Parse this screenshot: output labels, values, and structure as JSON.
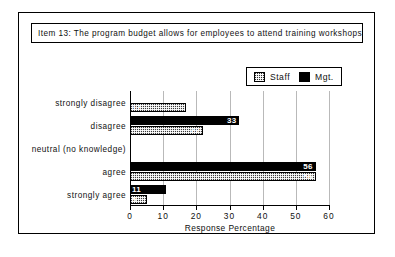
{
  "figure": {
    "item_caption": "Item 13:  The program budget allows for employees to attend training workshops"
  },
  "legend": {
    "entries": [
      {
        "label": "Staff",
        "swatch": "dithered-gray-swatch"
      },
      {
        "label": "Mgt.",
        "swatch": "solid-black-swatch"
      }
    ]
  },
  "chart_data": {
    "type": "bar",
    "orientation": "horizontal",
    "title": "Item 13:  The program budget allows for employees to attend training workshops",
    "categories": [
      "strongly disagree",
      "disagree",
      "neutral (no knowledge)",
      "agree",
      "strongly agree"
    ],
    "series": [
      {
        "name": "Mgt.",
        "values": [
          0,
          33,
          0,
          56,
          11
        ]
      },
      {
        "name": "Staff",
        "values": [
          17,
          22,
          0,
          56,
          5
        ]
      }
    ],
    "xlabel": "Response Percentage",
    "ylabel": "",
    "xlim": [
      0,
      60
    ],
    "xticks": [
      0,
      10,
      20,
      30,
      40,
      50,
      60
    ],
    "xticklabels": [
      "0",
      "10",
      "20",
      "30",
      "40",
      "50",
      "60"
    ],
    "grid": "vertical",
    "legend_position": "top-right",
    "colors": {
      "mgt": "#000000",
      "staff": "#3a3a3a",
      "axis": "#000000",
      "grid": "#b9b9b9"
    }
  }
}
